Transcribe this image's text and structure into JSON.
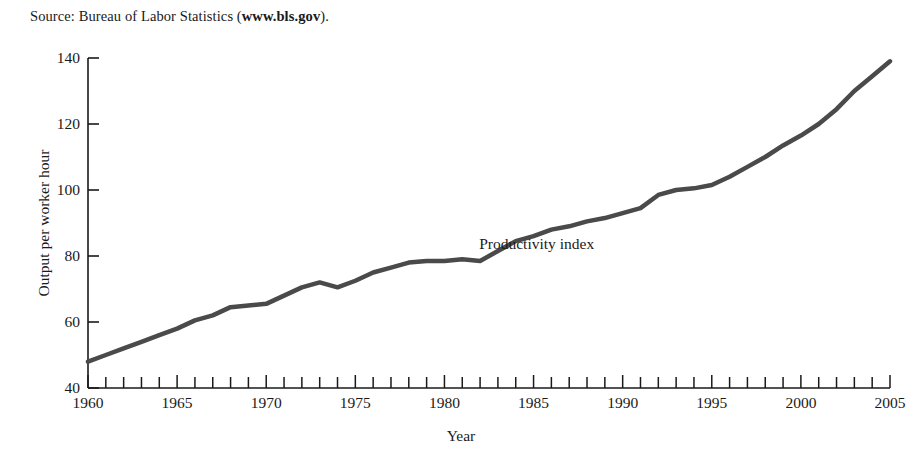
{
  "source_note": {
    "prefix": "Source: Bureau of Labor Statistics (",
    "bold": "www.bls.gov",
    "suffix": ")."
  },
  "chart_data": {
    "type": "line",
    "title": "",
    "subtitle": "",
    "xlabel": "Year",
    "ylabel": "Output per worker hour",
    "xlim": [
      1960,
      2005
    ],
    "ylim": [
      40,
      140
    ],
    "ytick_labels": [
      "40",
      "60",
      "80",
      "100",
      "120",
      "140"
    ],
    "yticks": [
      40,
      60,
      80,
      100,
      120,
      140
    ],
    "xtick_labels": [
      "1960",
      "1965",
      "1970",
      "1975",
      "1980",
      "1985",
      "1990",
      "1995",
      "2000",
      "2005"
    ],
    "xticks": [
      1960,
      1965,
      1970,
      1975,
      1980,
      1985,
      1990,
      1995,
      2000,
      2005
    ],
    "minor_xticks_every": 1,
    "grid": false,
    "legend_position": "inline-annotation",
    "annotations": [
      {
        "text": "Productivity index",
        "x": 1987,
        "y": 84
      }
    ],
    "series": [
      {
        "name": "Productivity index",
        "color": "#4a4a4a",
        "line_width": 4.5,
        "x": [
          1960,
          1961,
          1962,
          1963,
          1964,
          1965,
          1966,
          1967,
          1968,
          1969,
          1970,
          1971,
          1972,
          1973,
          1974,
          1975,
          1976,
          1977,
          1978,
          1979,
          1980,
          1981,
          1982,
          1983,
          1984,
          1985,
          1986,
          1987,
          1988,
          1989,
          1990,
          1991,
          1992,
          1993,
          1994,
          1995,
          1996,
          1997,
          1998,
          1999,
          2000,
          2001,
          2002,
          2003,
          2004,
          2005
        ],
        "values": [
          48.0,
          50.0,
          52.0,
          54.0,
          56.0,
          58.0,
          60.5,
          62.0,
          64.5,
          65.0,
          65.5,
          68.0,
          70.5,
          72.0,
          70.5,
          72.5,
          75.0,
          76.5,
          78.0,
          78.5,
          78.5,
          79.0,
          78.5,
          81.5,
          84.5,
          86.0,
          88.0,
          89.0,
          90.5,
          91.5,
          93.0,
          94.5,
          98.5,
          100.0,
          100.5,
          101.5,
          104.0,
          107.0,
          110.0,
          113.5,
          116.5,
          120.0,
          124.5,
          130.0,
          134.5,
          139.0
        ]
      }
    ]
  }
}
